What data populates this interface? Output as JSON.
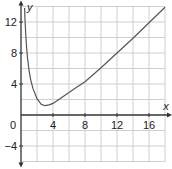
{
  "chart_data": {
    "type": "line",
    "title": "",
    "xlabel": "x",
    "ylabel": "y",
    "xlim": [
      0,
      18
    ],
    "ylim": [
      -6,
      14
    ],
    "grid": true,
    "grid_step": 2,
    "x_ticks": [
      4,
      8,
      12,
      16
    ],
    "y_ticks": [
      12,
      8,
      4,
      -4
    ],
    "origin_label": "0",
    "series": [
      {
        "name": "curve",
        "x": [
          0.45,
          0.5,
          0.6,
          0.7,
          0.8,
          1.0,
          1.2,
          1.5,
          2.0,
          2.5,
          3.0,
          3.5,
          4.0,
          5.0,
          6.0,
          7.0,
          8.0,
          10.0,
          12.0,
          14.0,
          16.0,
          18.0
        ],
        "y": [
          13.8,
          12.3,
          10.3,
          8.7,
          7.5,
          5.8,
          4.6,
          3.4,
          2.1,
          1.4,
          1.2,
          1.3,
          1.5,
          2.2,
          2.9,
          3.6,
          4.3,
          6.1,
          8.0,
          9.9,
          11.9,
          13.9
        ]
      }
    ],
    "colors": {
      "grid": "#cfcfcf",
      "axis": "#333333",
      "curve": "#555555"
    }
  }
}
